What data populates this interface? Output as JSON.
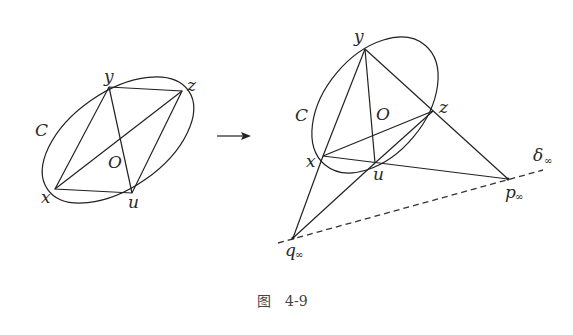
{
  "figure": {
    "caption_prefix": "图",
    "caption_number": "4-9"
  },
  "left_figure": {
    "conic_label": "C",
    "center_label": "O",
    "points": {
      "x": {
        "label": "x",
        "pos": [
          55,
          189
        ]
      },
      "y": {
        "label": "y",
        "pos": [
          109,
          87
        ]
      },
      "z": {
        "label": "z",
        "pos": [
          182,
          91
        ]
      },
      "u": {
        "label": "u",
        "pos": [
          132,
          193
        ]
      }
    }
  },
  "arrow": {
    "symbol": "→"
  },
  "right_figure": {
    "conic_label": "C",
    "center_label": "O",
    "points": {
      "x": {
        "label": "x",
        "pos": [
          323,
          156
        ]
      },
      "y": {
        "label": "y",
        "pos": [
          365,
          49
        ]
      },
      "z": {
        "label": "z",
        "pos": [
          433,
          111
        ]
      },
      "u": {
        "label": "u",
        "pos": [
          375,
          163
        ]
      },
      "p_inf": {
        "label": "p",
        "sub": "∞",
        "pos": [
          508,
          179
        ]
      },
      "q_inf": {
        "label": "q",
        "sub": "∞",
        "pos": [
          293,
          238
        ]
      }
    },
    "line_at_infinity": {
      "label": "δ",
      "sub": "∞"
    }
  }
}
